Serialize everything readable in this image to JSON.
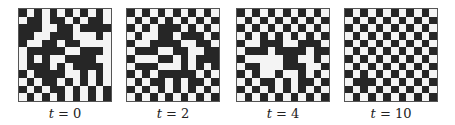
{
  "figure": {
    "panels": [
      {
        "label_var": "t",
        "label_eq": " = ",
        "label_val": "0",
        "left": 18,
        "rows": [
          "101010101010",
          "011011010110",
          "111001101111",
          "110011100010",
          "100110110000",
          "011111001110",
          "010100111100",
          "011101011110",
          "101111001010",
          "010110101010",
          "101011010101",
          "010101010101"
        ]
      },
      {
        "label_var": "t",
        "label_eq": " = ",
        "label_val": "2",
        "left": 126,
        "rows": [
          "101010101010",
          "010101010101",
          "101011101010",
          "010011011101",
          "100111100110",
          "011100110011",
          "100011010111",
          "011100010101",
          "101011111010",
          "010110101101",
          "101010101010",
          "010101010101"
        ]
      },
      {
        "label_var": "t",
        "label_eq": " = ",
        "label_val": "4",
        "left": 236,
        "rows": [
          "101010101010",
          "010101010101",
          "101010101010",
          "010101010101",
          "100111001110",
          "011101111011",
          "100000110010",
          "011000111001",
          "101001001010",
          "010110101101",
          "101010101010",
          "010101010101"
        ]
      },
      {
        "label_var": "t",
        "label_eq": " = ",
        "label_val": "10",
        "left": 344,
        "rows": [
          "101010101010",
          "010101010101",
          "101010101010",
          "010101010101",
          "101010101010",
          "010101010101",
          "101010101010",
          "010101010101",
          "101010101010",
          "011101010101",
          "101010101010",
          "010101010101"
        ]
      }
    ],
    "colors": {
      "black": "#262626",
      "white": "#f4f4f4"
    }
  }
}
